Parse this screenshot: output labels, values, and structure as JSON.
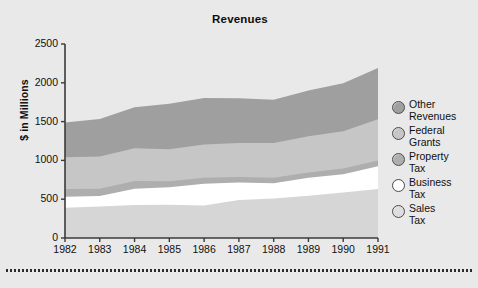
{
  "figure": {
    "title": "Revenues",
    "footer_rule": "dotted-rule"
  },
  "chart_data": {
    "type": "area",
    "stacked": true,
    "title": "Revenues",
    "xlabel": "",
    "ylabel": "$ in Millions",
    "ylim": [
      0,
      2500
    ],
    "yticks": [
      0,
      500,
      1000,
      1500,
      2000,
      2500
    ],
    "ytick_labels": [
      "0",
      "500",
      "1000",
      "1500",
      "2000",
      "2500"
    ],
    "grid": false,
    "legend_position": "right",
    "categories": [
      1982,
      1983,
      1984,
      1985,
      1986,
      1987,
      1988,
      1989,
      1990,
      1991
    ],
    "xtick_labels": [
      "1982",
      "1983",
      "1984",
      "1985",
      "1986",
      "1987",
      "1988",
      "1989",
      "1990",
      "1991"
    ],
    "series": [
      {
        "name": "Sales Tax",
        "color": "#d6d6d6",
        "values": [
          390,
          405,
          425,
          430,
          420,
          490,
          510,
          545,
          585,
          630
        ]
      },
      {
        "name": "Business Tax",
        "color": "#ffffff",
        "values": [
          140,
          135,
          210,
          225,
          280,
          225,
          195,
          230,
          235,
          295
        ]
      },
      {
        "name": "Property Tax",
        "color": "#aeaeae",
        "values": [
          100,
          95,
          100,
          75,
          75,
          70,
          70,
          70,
          75,
          75
        ]
      },
      {
        "name": "Federal Grants",
        "color": "#c6c6c6",
        "values": [
          410,
          415,
          420,
          415,
          430,
          440,
          450,
          465,
          480,
          530
        ]
      },
      {
        "name": "Other Revenues",
        "color": "#9f9f9f",
        "values": [
          450,
          485,
          530,
          585,
          600,
          575,
          555,
          590,
          620,
          660
        ]
      }
    ],
    "cumulative_tops": {
      "Sales Tax": [
        390,
        405,
        425,
        430,
        420,
        490,
        510,
        545,
        585,
        630
      ],
      "Business Tax": [
        530,
        540,
        635,
        655,
        700,
        715,
        705,
        775,
        820,
        925
      ],
      "Property Tax": [
        630,
        635,
        735,
        730,
        775,
        785,
        775,
        845,
        895,
        1000
      ],
      "Federal Grants": [
        1040,
        1050,
        1155,
        1145,
        1205,
        1225,
        1225,
        1310,
        1375,
        1530
      ],
      "Other Revenues": [
        1490,
        1535,
        1685,
        1730,
        1805,
        1800,
        1780,
        1900,
        1995,
        2190
      ]
    }
  },
  "legend": {
    "items": [
      {
        "label": "Other\nRevenues",
        "swatch": "#9f9f9f",
        "icon": "circle-marker"
      },
      {
        "label": "Federal\nGrants",
        "swatch": "#c6c6c6",
        "icon": "circle-marker"
      },
      {
        "label": "Property\nTax",
        "swatch": "#aeaeae",
        "icon": "circle-marker"
      },
      {
        "label": "Business\nTax",
        "swatch": "#ffffff",
        "icon": "circle-marker"
      },
      {
        "label": "Sales\nTax",
        "swatch": "#dedede",
        "icon": "circle-marker"
      }
    ]
  },
  "colors": {
    "background": "#e9e9e9",
    "axis": "#3a3a3a",
    "text": "#101010"
  }
}
